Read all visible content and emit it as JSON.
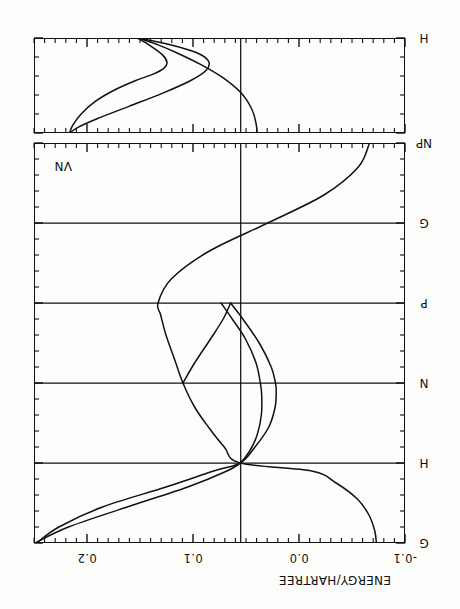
{
  "figure": {
    "title": "",
    "axis_label_energy": "ENERGY/HARTREE",
    "corner_tag": "VN",
    "rotation_deg": 180
  },
  "chart_data": {
    "type": "line",
    "title": "",
    "subtitle": "",
    "xlabel": "",
    "ylabel": "ENERGY/HARTREE",
    "ylim": [
      -0.1,
      0.25
    ],
    "ytick_values": [
      -0.1,
      0.0,
      0.1,
      0.2
    ],
    "ytick_labels": [
      "-0.1",
      "0.0",
      "0.1",
      "0.2"
    ],
    "grid": false,
    "legend": "none",
    "fermi_level": 0.055,
    "panels": [
      {
        "name": "main-panel",
        "kpath_labels": [
          "G",
          "H",
          "N",
          "P",
          "G",
          "NP"
        ],
        "kpath_positions": [
          0.0,
          1.0,
          2.0,
          3.0,
          4.0,
          5.0
        ],
        "xlim": [
          0.0,
          5.0
        ],
        "series": [
          {
            "name": "band-1",
            "x": [
              0.0,
              0.15,
              0.35,
              0.55,
              0.75,
              0.9,
              1.0,
              1.2,
              1.45,
              1.7,
              2.0,
              2.3,
              2.6,
              2.85,
              3.0,
              3.3,
              3.65,
              4.0,
              4.35,
              4.7,
              5.0
            ],
            "y": [
              -0.073,
              -0.0715,
              -0.066,
              -0.055,
              -0.035,
              -0.012,
              0.0555,
              0.0705,
              0.0855,
              0.0985,
              0.1095,
              0.1175,
              0.1255,
              0.1305,
              0.133,
              0.1205,
              0.0845,
              0.0295,
              -0.0235,
              -0.056,
              -0.0665
            ]
          },
          {
            "name": "band-2",
            "x": [
              0.0,
              0.2,
              0.45,
              0.7,
              0.9,
              1.0,
              1.15,
              1.35,
              1.6,
              1.85,
              2.0,
              2.25,
              2.55,
              2.8,
              3.0
            ],
            "y": [
              0.249,
              0.2175,
              0.162,
              0.105,
              0.068,
              0.0555,
              0.0465,
              0.0395,
              0.0355,
              0.0352,
              0.0365,
              0.0405,
              0.0505,
              0.063,
              0.0735
            ]
          },
          {
            "name": "band-3",
            "x": [
              0.0,
              0.2,
              0.45,
              0.7,
              0.9,
              1.0,
              1.2,
              1.45,
              1.7,
              1.9,
              2.0,
              2.2,
              2.5,
              2.8,
              3.0
            ],
            "y": [
              0.2475,
              0.2265,
              0.1855,
              0.1255,
              0.0805,
              0.0555,
              0.0415,
              0.0285,
              0.0225,
              0.0215,
              0.0222,
              0.0262,
              0.0375,
              0.053,
              0.0645
            ]
          },
          {
            "name": "band-4",
            "x": [
              2.0,
              2.25,
              2.55,
              2.8,
              3.0
            ],
            "y": [
              0.1095,
              0.0985,
              0.0835,
              0.0715,
              0.0645
            ]
          }
        ]
      },
      {
        "name": "upper-panel",
        "kpath_labels": [
          "NP",
          "H"
        ],
        "kpath_positions": [
          0.0,
          1.0
        ],
        "xlim": [
          0.0,
          1.0
        ],
        "series": [
          {
            "name": "band-u1",
            "x": [
              0.0,
              0.08,
              0.2,
              0.33,
              0.45,
              0.55,
              0.62,
              0.68,
              0.74,
              0.82,
              0.92,
              1.0
            ],
            "y": [
              0.2165,
              0.2135,
              0.2055,
              0.1925,
              0.1745,
              0.1545,
              0.1375,
              0.1275,
              0.1245,
              0.1285,
              0.1405,
              0.1525
            ]
          },
          {
            "name": "band-u2",
            "x": [
              0.0,
              0.06,
              0.15,
              0.28,
              0.42,
              0.55,
              0.66,
              0.76,
              0.85,
              0.93,
              1.0
            ],
            "y": [
              0.2165,
              0.2085,
              0.1905,
              0.1605,
              0.1285,
              0.1025,
              0.0875,
              0.0855,
              0.0975,
              0.1215,
              0.1515
            ]
          },
          {
            "name": "band-u3",
            "x": [
              0.0,
              0.1,
              0.25,
              0.42,
              0.58,
              0.72,
              0.84,
              0.93,
              1.0
            ],
            "y": [
              0.0395,
              0.0405,
              0.0445,
              0.0545,
              0.0715,
              0.0925,
              0.1145,
              0.1335,
              0.1515
            ]
          }
        ]
      }
    ]
  }
}
